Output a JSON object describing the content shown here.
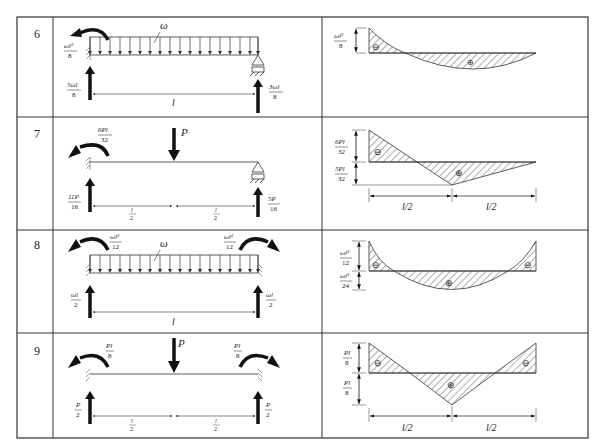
{
  "table": {
    "rows": [
      {
        "number": "6",
        "beam": {
          "load_label": "ω",
          "left_moment": {
            "num": "ωl²",
            "den": "8"
          },
          "left_reaction": {
            "num": "5ωl",
            "den": "8"
          },
          "right_reaction": {
            "num": "3ωl",
            "den": "8"
          },
          "span": "l"
        },
        "moment": {
          "top_value": {
            "num": "ωl²",
            "den": "8"
          },
          "signs": [
            "⊖",
            "⊕"
          ]
        }
      },
      {
        "number": "7",
        "beam": {
          "point_load": "P",
          "left_moment": {
            "num": "6Pl",
            "den": "32"
          },
          "left_reaction": {
            "num": "11P",
            "den": "16"
          },
          "right_reaction": {
            "num": "5P",
            "den": "16"
          },
          "spans": [
            {
              "num": "l",
              "den": "2"
            },
            {
              "num": "l",
              "den": "2"
            }
          ]
        },
        "moment": {
          "top_value": {
            "num": "6Pl",
            "den": "32"
          },
          "bottom_value": {
            "num": "5Pl",
            "den": "32"
          },
          "spans": [
            "l/2",
            "l/2"
          ],
          "signs": [
            "⊖",
            "⊕"
          ]
        }
      },
      {
        "number": "8",
        "beam": {
          "load_label": "ω",
          "left_moment": {
            "num": "ωl²",
            "den": "12"
          },
          "right_moment": {
            "num": "ωl²",
            "den": "12"
          },
          "left_reaction": {
            "num": "ωl",
            "den": "2"
          },
          "right_reaction": {
            "num": "ωl",
            "den": "2"
          },
          "span": "l"
        },
        "moment": {
          "top_value": {
            "num": "ωl²",
            "den": "12"
          },
          "bottom_value": {
            "num": "ωl²",
            "den": "24"
          },
          "signs": [
            "⊖",
            "⊕",
            "⊖"
          ]
        }
      },
      {
        "number": "9",
        "beam": {
          "point_load": "P",
          "left_moment": {
            "num": "Pl",
            "den": "8"
          },
          "right_moment": {
            "num": "Pl",
            "den": "8"
          },
          "left_reaction": {
            "num": "P",
            "den": "2"
          },
          "right_reaction": {
            "num": "P",
            "den": "2"
          },
          "spans": [
            {
              "num": "l",
              "den": "2"
            },
            {
              "num": "l",
              "den": "2"
            }
          ]
        },
        "moment": {
          "top_value": {
            "num": "Pl",
            "den": "8"
          },
          "bottom_value": {
            "num": "Pl",
            "den": "8"
          },
          "spans": [
            "l/2",
            "l/2"
          ],
          "signs": [
            "⊖",
            "⊕",
            "⊖"
          ]
        }
      }
    ]
  }
}
